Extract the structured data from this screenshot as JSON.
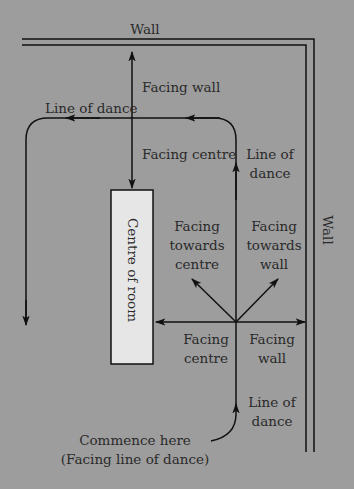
{
  "diagram": {
    "colors": {
      "background": "#9d9d9d",
      "line": "#111111",
      "room_fill": "#e6e6e6",
      "text": "#2a2a2a"
    },
    "labels": {
      "wall_top": "Wall",
      "wall_right": "Wall",
      "facing_wall_top": "Facing wall",
      "line_of_dance_top": "Line of dance",
      "facing_centre_top": "Facing centre",
      "line_of_dance_right_1": "Line of",
      "line_of_dance_right_2": "dance",
      "centre_of_room": "Centre of room",
      "facing_towards_centre_1": "Facing",
      "facing_towards_centre_2": "towards",
      "facing_towards_centre_3": "centre",
      "facing_towards_wall_1": "Facing",
      "facing_towards_wall_2": "towards",
      "facing_towards_wall_3": "wall",
      "facing_centre_bottom_1": "Facing",
      "facing_centre_bottom_2": "centre",
      "facing_wall_bottom_1": "Facing",
      "facing_wall_bottom_2": "wall",
      "line_of_dance_bottom_1": "Line of",
      "line_of_dance_bottom_2": "dance",
      "commence_1": "Commence here",
      "commence_2": "(Facing line of dance)"
    }
  }
}
